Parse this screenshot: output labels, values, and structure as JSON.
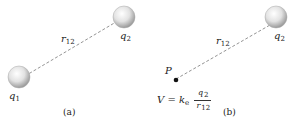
{
  "panel_a": {
    "charge1": {
      "sym": "q",
      "sub": "1"
    },
    "charge2": {
      "sym": "q",
      "sub": "2"
    },
    "distance": {
      "sym": "r",
      "sub": "12"
    },
    "caption": "(a)"
  },
  "panel_b": {
    "charge2": {
      "sym": "q",
      "sub": "2"
    },
    "distance": {
      "sym": "r",
      "sub": "12"
    },
    "point": "P",
    "formula": {
      "lhs": "V = k",
      "lhs_sub": "e",
      "num_sym": "q",
      "num_sub": "2",
      "den_sym": "r",
      "den_sub": "12"
    },
    "caption": "(b)"
  },
  "colors": {
    "line": "#888888",
    "sphere_light": "#ffffff",
    "sphere_dark": "#a8a8a8"
  }
}
